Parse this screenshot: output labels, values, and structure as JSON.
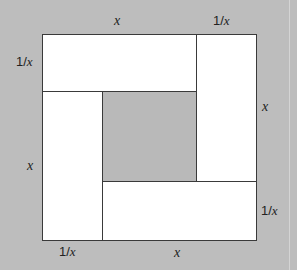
{
  "diagram": {
    "colors": {
      "background": "#bdbdbd",
      "rect_fill": "#ffffff",
      "stroke": "#3a3a3a"
    },
    "labels": {
      "top_x": "x",
      "top_inv": "1/",
      "top_inv_var": "x",
      "left_inv": "1/",
      "left_inv_var": "x",
      "right_x": "x",
      "left_x": "x",
      "right_inv": "1/",
      "right_inv_var": "x",
      "bottom_inv": "1/",
      "bottom_inv_var": "x",
      "bottom_x": "x"
    },
    "rectangles": [
      {
        "name": "top",
        "width": "x",
        "height": "1/x"
      },
      {
        "name": "right",
        "width": "1/x",
        "height": "x"
      },
      {
        "name": "bottom",
        "width": "x",
        "height": "1/x"
      },
      {
        "name": "left",
        "width": "1/x",
        "height": "x"
      }
    ]
  }
}
